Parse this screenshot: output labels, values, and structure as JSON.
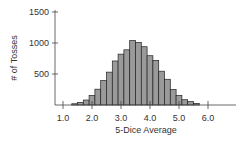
{
  "chart_data": {
    "type": "bar",
    "title": "",
    "xlabel": "5-Dice Average",
    "ylabel": "# of Tosses",
    "x_ticks": [
      "1.0",
      "2.0",
      "3.0",
      "4.0",
      "5.0",
      "6.0"
    ],
    "y_ticks": [
      "500",
      "1000",
      "1500"
    ],
    "xlim": [
      0.9,
      6.9
    ],
    "ylim": [
      0,
      1500
    ],
    "grid": false,
    "bar_width": 0.2,
    "categories": [
      1.4,
      1.6,
      1.8,
      2.0,
      2.2,
      2.4,
      2.6,
      2.8,
      3.0,
      3.2,
      3.4,
      3.6,
      3.8,
      4.0,
      4.2,
      4.4,
      4.6,
      4.8,
      5.0,
      5.2,
      5.4,
      5.6
    ],
    "values": [
      20,
      40,
      80,
      155,
      255,
      395,
      530,
      710,
      820,
      890,
      1040,
      1010,
      940,
      795,
      720,
      545,
      415,
      250,
      155,
      85,
      55,
      25
    ],
    "colors": {
      "bar_fill": "#9a9a9a",
      "bar_stroke": "#222222",
      "axis": "#444444"
    }
  }
}
